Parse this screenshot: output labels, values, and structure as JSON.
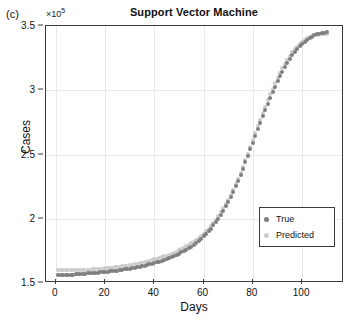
{
  "panel_label": "(c)",
  "y_exponent_prefix": "×10",
  "y_exponent_power": "5",
  "legend": {
    "items": [
      {
        "label": "True",
        "color": "#7f7f7f"
      },
      {
        "label": "Predicted",
        "color": "#cccccc"
      }
    ]
  },
  "chart_data": {
    "type": "scatter",
    "title": "Support Vector Machine",
    "xlabel": "Days",
    "ylabel": "Cases",
    "y_multiplier": 100000,
    "y_multiplier_label": "×10⁵",
    "xlim": [
      -4,
      117
    ],
    "ylim": [
      1.5,
      3.5
    ],
    "xticks": [
      0,
      20,
      40,
      60,
      80,
      100
    ],
    "yticks": [
      1.5,
      2,
      2.5,
      3,
      3.5
    ],
    "grid": true,
    "legend_position": "lower right",
    "x": [
      1,
      2,
      3,
      4,
      5,
      6,
      7,
      8,
      9,
      10,
      11,
      12,
      13,
      14,
      15,
      16,
      17,
      18,
      19,
      20,
      21,
      22,
      23,
      24,
      25,
      26,
      27,
      28,
      29,
      30,
      31,
      32,
      33,
      34,
      35,
      36,
      37,
      38,
      39,
      40,
      41,
      42,
      43,
      44,
      45,
      46,
      47,
      48,
      49,
      50,
      51,
      52,
      53,
      54,
      55,
      56,
      57,
      58,
      59,
      60,
      61,
      62,
      63,
      64,
      65,
      66,
      67,
      68,
      69,
      70,
      71,
      72,
      73,
      74,
      75,
      76,
      77,
      78,
      79,
      80,
      81,
      82,
      83,
      84,
      85,
      86,
      87,
      88,
      89,
      90,
      91,
      92,
      93,
      94,
      95,
      96,
      97,
      98,
      99,
      100,
      101,
      102,
      103,
      104,
      105,
      106,
      107,
      108,
      109,
      110
    ],
    "series": [
      {
        "name": "True",
        "color": "#7f7f7f",
        "values": [
          1.56,
          1.561,
          1.562,
          1.563,
          1.564,
          1.565,
          1.566,
          1.567,
          1.568,
          1.57,
          1.571,
          1.572,
          1.574,
          1.575,
          1.577,
          1.578,
          1.58,
          1.582,
          1.584,
          1.586,
          1.588,
          1.59,
          1.592,
          1.595,
          1.597,
          1.6,
          1.603,
          1.606,
          1.609,
          1.612,
          1.616,
          1.619,
          1.623,
          1.627,
          1.631,
          1.636,
          1.64,
          1.645,
          1.65,
          1.656,
          1.661,
          1.667,
          1.673,
          1.68,
          1.687,
          1.694,
          1.702,
          1.71,
          1.719,
          1.728,
          1.738,
          1.748,
          1.759,
          1.771,
          1.784,
          1.797,
          1.812,
          1.827,
          1.844,
          1.862,
          1.881,
          1.902,
          1.924,
          1.948,
          1.974,
          2.001,
          2.031,
          2.062,
          2.096,
          2.131,
          2.169,
          2.209,
          2.251,
          2.295,
          2.341,
          2.389,
          2.438,
          2.489,
          2.54,
          2.592,
          2.644,
          2.696,
          2.747,
          2.797,
          2.846,
          2.894,
          2.94,
          2.985,
          3.028,
          3.069,
          3.108,
          3.145,
          3.18,
          3.213,
          3.244,
          3.272,
          3.298,
          3.322,
          3.343,
          3.362,
          3.379,
          3.394,
          3.407,
          3.418,
          3.427,
          3.434,
          3.44,
          3.444,
          3.447,
          3.45
        ]
      },
      {
        "name": "Predicted",
        "color": "#cccccc",
        "values": [
          1.598,
          1.598,
          1.598,
          1.598,
          1.598,
          1.599,
          1.599,
          1.6,
          1.6,
          1.601,
          1.602,
          1.603,
          1.604,
          1.605,
          1.606,
          1.607,
          1.609,
          1.61,
          1.612,
          1.614,
          1.616,
          1.618,
          1.62,
          1.622,
          1.625,
          1.627,
          1.63,
          1.633,
          1.636,
          1.639,
          1.643,
          1.646,
          1.65,
          1.654,
          1.658,
          1.663,
          1.667,
          1.672,
          1.677,
          1.683,
          1.688,
          1.694,
          1.7,
          1.707,
          1.714,
          1.721,
          1.729,
          1.737,
          1.745,
          1.754,
          1.764,
          1.774,
          1.785,
          1.797,
          1.809,
          1.822,
          1.836,
          1.851,
          1.867,
          1.885,
          1.904,
          1.924,
          1.946,
          1.969,
          1.994,
          2.021,
          2.05,
          2.081,
          2.114,
          2.149,
          2.186,
          2.226,
          2.268,
          2.312,
          2.358,
          2.406,
          2.456,
          2.507,
          2.559,
          2.612,
          2.665,
          2.718,
          2.77,
          2.822,
          2.872,
          2.921,
          2.968,
          3.013,
          3.056,
          3.097,
          3.136,
          3.172,
          3.206,
          3.238,
          3.267,
          3.294,
          3.318,
          3.34,
          3.359,
          3.376,
          3.391,
          3.403,
          3.413,
          3.421,
          3.427,
          3.431,
          3.434,
          3.436,
          3.437,
          3.437
        ]
      }
    ]
  }
}
